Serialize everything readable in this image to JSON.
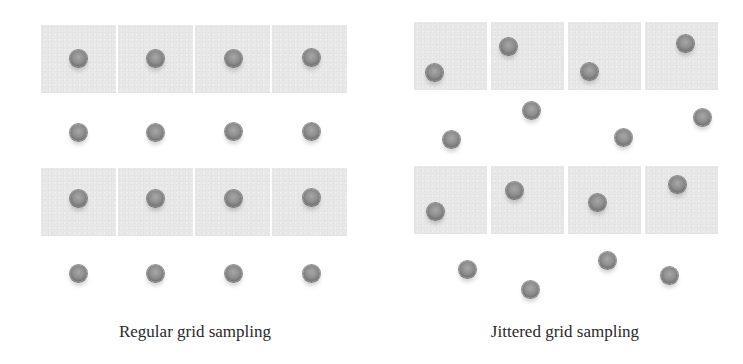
{
  "figure": {
    "panels": [
      {
        "id": "regular",
        "caption": "Regular grid sampling",
        "caption_box": {
          "x": 60,
          "y": 322,
          "w": 270
        },
        "cell_color": "#e7e7e7",
        "cells": [
          {
            "x": 41,
            "y": 25,
            "w": 75,
            "h": 68
          },
          {
            "x": 118,
            "y": 25,
            "w": 75,
            "h": 68
          },
          {
            "x": 195,
            "y": 25,
            "w": 75,
            "h": 68
          },
          {
            "x": 272,
            "y": 25,
            "w": 75,
            "h": 68
          },
          {
            "x": 41,
            "y": 168,
            "w": 75,
            "h": 68
          },
          {
            "x": 118,
            "y": 168,
            "w": 75,
            "h": 68
          },
          {
            "x": 195,
            "y": 168,
            "w": 75,
            "h": 68
          },
          {
            "x": 272,
            "y": 168,
            "w": 75,
            "h": 68
          }
        ],
        "samples": [
          {
            "x": 78,
            "y": 58
          },
          {
            "x": 155,
            "y": 58
          },
          {
            "x": 233,
            "y": 58
          },
          {
            "x": 311,
            "y": 57
          },
          {
            "x": 78,
            "y": 132
          },
          {
            "x": 155,
            "y": 132
          },
          {
            "x": 233,
            "y": 131
          },
          {
            "x": 311,
            "y": 131
          },
          {
            "x": 78,
            "y": 198
          },
          {
            "x": 155,
            "y": 198
          },
          {
            "x": 233,
            "y": 198
          },
          {
            "x": 311,
            "y": 197
          },
          {
            "x": 78,
            "y": 273
          },
          {
            "x": 155,
            "y": 273
          },
          {
            "x": 233,
            "y": 273
          },
          {
            "x": 311,
            "y": 273
          }
        ]
      },
      {
        "id": "jittered",
        "caption": "Jittered grid sampling",
        "caption_box": {
          "x": 430,
          "y": 322,
          "w": 270
        },
        "cell_color": "#e7e7e7",
        "cells": [
          {
            "x": 414,
            "y": 22,
            "w": 73,
            "h": 68
          },
          {
            "x": 491,
            "y": 22,
            "w": 73,
            "h": 68
          },
          {
            "x": 568,
            "y": 22,
            "w": 73,
            "h": 68
          },
          {
            "x": 645,
            "y": 22,
            "w": 73,
            "h": 68
          },
          {
            "x": 414,
            "y": 166,
            "w": 73,
            "h": 68
          },
          {
            "x": 491,
            "y": 166,
            "w": 73,
            "h": 68
          },
          {
            "x": 568,
            "y": 166,
            "w": 73,
            "h": 68
          },
          {
            "x": 645,
            "y": 166,
            "w": 73,
            "h": 68
          }
        ],
        "samples": [
          {
            "x": 434,
            "y": 72
          },
          {
            "x": 508,
            "y": 46
          },
          {
            "x": 589,
            "y": 71
          },
          {
            "x": 685,
            "y": 43
          },
          {
            "x": 451,
            "y": 139
          },
          {
            "x": 531,
            "y": 110
          },
          {
            "x": 623,
            "y": 137
          },
          {
            "x": 702,
            "y": 117
          },
          {
            "x": 435,
            "y": 211
          },
          {
            "x": 514,
            "y": 190
          },
          {
            "x": 597,
            "y": 202
          },
          {
            "x": 677,
            "y": 184
          },
          {
            "x": 467,
            "y": 269
          },
          {
            "x": 530,
            "y": 289
          },
          {
            "x": 607,
            "y": 260
          },
          {
            "x": 669,
            "y": 275
          }
        ]
      }
    ]
  }
}
